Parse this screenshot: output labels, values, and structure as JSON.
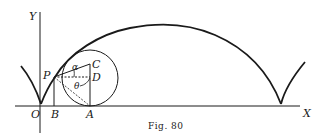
{
  "figure": {
    "caption": "Fig. 80",
    "type": "cycloid construction",
    "labels": {
      "y_axis": "Y",
      "x_axis": "X",
      "origin": "O",
      "point_p": "P",
      "point_b": "B",
      "point_a": "A",
      "point_c": "C",
      "point_d": "D",
      "angle_alpha": "α",
      "angle_theta": "θ"
    },
    "colors": {
      "ink": "#1a1a1a",
      "background": "#ffffff"
    }
  }
}
